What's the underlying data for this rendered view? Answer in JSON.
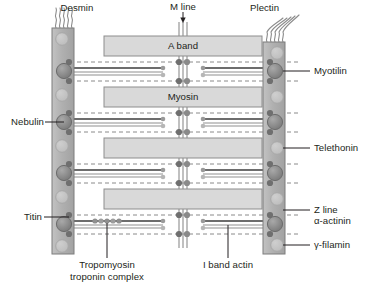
{
  "figure": {
    "type": "anatomical-schematic"
  },
  "colors": {
    "background": "#ffffff",
    "text": "#231f20",
    "zline_fill": "#b3b3b3",
    "zline_stroke": "#808080",
    "box_fill": "#d9d9d9",
    "box_stroke": "#808080",
    "filament_dark": "#6d6d6d",
    "filament_light": "#b5b5b5",
    "bead_dark": "#6f6f6f",
    "bead_mid": "#9a9a9a",
    "bead_light": "#c4c4c4",
    "dash_line": "#8a8a8a",
    "leader_line": "#231f20",
    "squiggle": "#808080"
  },
  "labels": {
    "desmin": "Desmin",
    "m_line": "M line",
    "plectin": "Plectin",
    "myotilin": "Myotilin",
    "nebulin": "Nebulin",
    "telethonin": "Telethonin",
    "titin": "Titin",
    "z_line": "Z line",
    "alpha_actinin": "α-actinin",
    "gamma_filamin": "γ-filamin",
    "tropomyosin_line1": "Tropomyosin",
    "tropomyosin_line2": "troponin complex",
    "i_band_actin": "I band actin"
  },
  "boxes": [
    {
      "label": "A band",
      "x": 104,
      "y": 36,
      "w": 158,
      "h": 20
    },
    {
      "label": "Myosin",
      "x": 104,
      "y": 87,
      "w": 158,
      "h": 20
    },
    {
      "label": "",
      "x": 104,
      "y": 138,
      "w": 158,
      "h": 20
    },
    {
      "label": "",
      "x": 104,
      "y": 189,
      "w": 158,
      "h": 20
    }
  ],
  "structures": {
    "z_line_left": {
      "x": 52,
      "y": 28,
      "w": 22,
      "h": 226
    },
    "z_line_right": {
      "x": 263,
      "y": 42,
      "w": 22,
      "h": 212
    },
    "repeat_units": 4,
    "m_line_bars": 3
  },
  "annotations": {
    "dashed_rows": 8,
    "actin_filament_pairs": 4,
    "tropomyosin_beads": 5
  }
}
